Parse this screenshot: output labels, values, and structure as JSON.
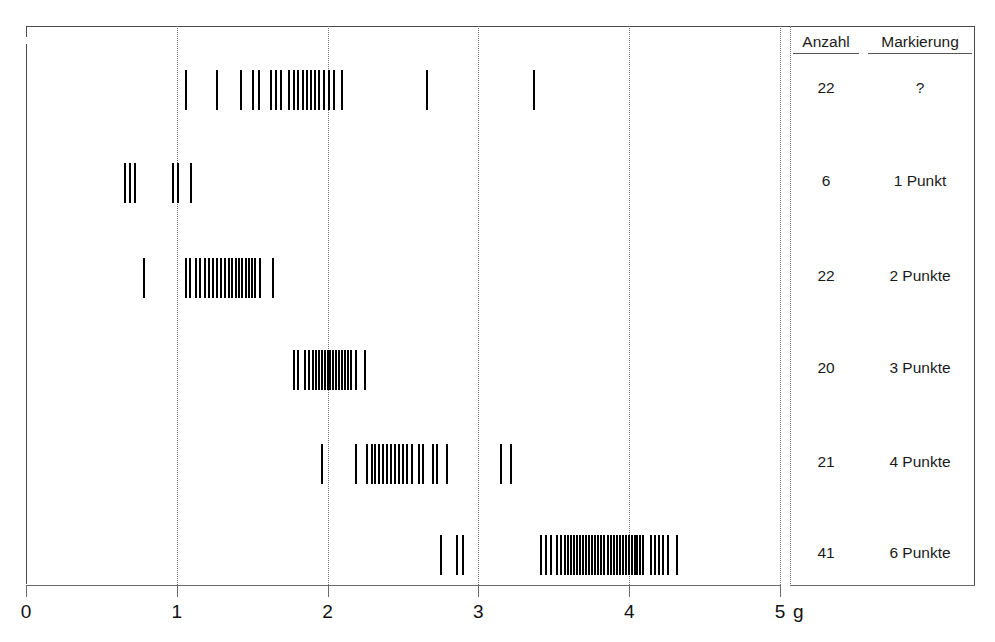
{
  "chart_data": {
    "type": "strip",
    "title": "",
    "xlabel": "g",
    "ylabel": "",
    "xlim": [
      0,
      5
    ],
    "xticks": [
      0,
      1,
      2,
      3,
      4,
      5
    ],
    "xtick_labels": [
      "0",
      "1",
      "2",
      "3",
      "4",
      "5"
    ],
    "unit": "g",
    "grid": true,
    "gridlines_at": [
      1,
      2,
      3,
      4,
      5
    ],
    "legend": "none",
    "table_headers": [
      "Anzahl",
      "Markierung"
    ],
    "series": [
      {
        "name": "?",
        "count": "22",
        "markierung": "?",
        "values": [
          1.055,
          1.26,
          1.419,
          1.498,
          1.538,
          1.618,
          1.651,
          1.684,
          1.737,
          1.77,
          1.797,
          1.83,
          1.856,
          1.883,
          1.91,
          1.936,
          1.969,
          2.002,
          2.035,
          2.088,
          2.652,
          3.362
        ]
      },
      {
        "name": "1 Punkt",
        "count": "6",
        "markierung": "1 Punkt",
        "values": [
          0.65,
          0.683,
          0.716,
          0.969,
          1.001,
          1.087
        ]
      },
      {
        "name": "2 Punkte",
        "count": "22",
        "markierung": "2 Punkte",
        "values": [
          0.776,
          1.055,
          1.081,
          1.121,
          1.148,
          1.181,
          1.207,
          1.234,
          1.26,
          1.287,
          1.313,
          1.34,
          1.36,
          1.386,
          1.406,
          1.426,
          1.452,
          1.472,
          1.492,
          1.512,
          1.545,
          1.631
        ]
      },
      {
        "name": "3 Punkte",
        "count": "20",
        "markierung": "3 Punkte",
        "values": [
          1.77,
          1.796,
          1.843,
          1.869,
          1.896,
          1.916,
          1.936,
          1.956,
          1.976,
          1.996,
          2.009,
          2.029,
          2.049,
          2.069,
          2.089,
          2.109,
          2.128,
          2.148,
          2.181,
          2.241
        ]
      },
      {
        "name": "4 Punkte",
        "count": "21",
        "markierung": "4 Punkte",
        "values": [
          1.956,
          2.181,
          2.254,
          2.287,
          2.307,
          2.334,
          2.36,
          2.387,
          2.413,
          2.44,
          2.466,
          2.493,
          2.519,
          2.553,
          2.599,
          2.626,
          2.692,
          2.718,
          2.785,
          3.143,
          3.21
        ]
      },
      {
        "name": "6 Punkte",
        "count": "41",
        "markierung": "6 Punkte",
        "values": [
          2.745,
          2.851,
          2.891,
          3.409,
          3.442,
          3.475,
          3.515,
          3.542,
          3.568,
          3.588,
          3.608,
          3.628,
          3.648,
          3.668,
          3.688,
          3.708,
          3.728,
          3.748,
          3.768,
          3.788,
          3.808,
          3.828,
          3.854,
          3.874,
          3.894,
          3.914,
          3.934,
          3.954,
          3.974,
          3.994,
          4.014,
          4.034,
          4.047,
          4.067,
          4.087,
          4.14,
          4.167,
          4.193,
          4.22,
          4.253,
          4.312
        ]
      }
    ]
  },
  "table": {
    "headers": {
      "count": "Anzahl",
      "marking": "Markierung"
    },
    "rows": [
      {
        "count": "22",
        "marking": "?"
      },
      {
        "count": "6",
        "marking": "1 Punkt"
      },
      {
        "count": "22",
        "marking": "2 Punkte"
      },
      {
        "count": "20",
        "marking": "3 Punkte"
      },
      {
        "count": "21",
        "marking": "4 Punkte"
      },
      {
        "count": "41",
        "marking": "6 Punkte"
      }
    ]
  },
  "axis": {
    "tick_labels": [
      "0",
      "1",
      "2",
      "3",
      "4",
      "5"
    ],
    "unit_label": "g"
  },
  "colors": {
    "mark": "#000000",
    "frame": "#4a4a4a",
    "grid": "#6f6f6f",
    "text": "#1a1a1a"
  }
}
